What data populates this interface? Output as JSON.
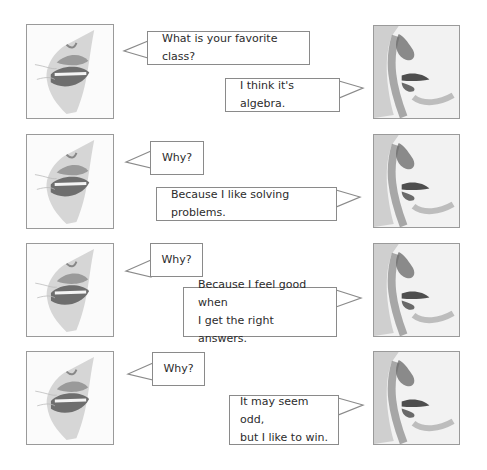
{
  "dialogue": [
    {
      "row": 1,
      "speaker_left": {
        "text": "What is your favorite class?"
      },
      "speaker_right": {
        "text": "I think it's algebra."
      }
    },
    {
      "row": 2,
      "speaker_left": {
        "text": "Why?"
      },
      "speaker_right": {
        "text": "Because I like solving problems."
      }
    },
    {
      "row": 3,
      "speaker_left": {
        "text": "Why?"
      },
      "speaker_right": {
        "text": "Because I feel good when\nI get the right answers."
      }
    },
    {
      "row": 4,
      "speaker_left": {
        "text": "Why?"
      },
      "speaker_right": {
        "text": "It may seem odd,\nbut I like to win."
      }
    }
  ],
  "images": {
    "left": "grinning-mouth-sketch",
    "right": "profile-lips-sketch"
  }
}
